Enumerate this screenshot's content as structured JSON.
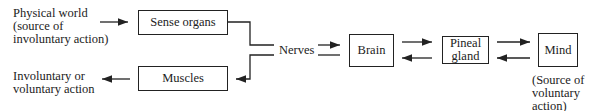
{
  "diagram": {
    "nodes": {
      "physical_world": "Physical world\n(source of\ninvoluntary action)",
      "sense_organs": "Sense organs",
      "muscles": "Muscles",
      "action": "Involuntary or\nvoluntary action",
      "nerves": "Nerves",
      "brain": "Brain",
      "pineal_gland": "Pineal\ngland",
      "mind": "Mind",
      "mind_note": "(Source of\nvoluntary\naction)"
    },
    "edges": [
      {
        "from": "Physical world",
        "to": "Sense organs"
      },
      {
        "from": "Sense organs",
        "to": "Nerves"
      },
      {
        "from": "Nerves",
        "to": "Muscles"
      },
      {
        "from": "Muscles",
        "to": "Involuntary or voluntary action"
      },
      {
        "from": "Nerves",
        "to": "Brain"
      },
      {
        "from": "Brain",
        "to": "Nerves"
      },
      {
        "from": "Brain",
        "to": "Pineal gland"
      },
      {
        "from": "Pineal gland",
        "to": "Brain"
      },
      {
        "from": "Pineal gland",
        "to": "Mind"
      },
      {
        "from": "Mind",
        "to": "Pineal gland"
      }
    ]
  }
}
